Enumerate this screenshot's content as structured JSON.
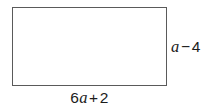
{
  "figure": {
    "type": "rectangle-diagram",
    "background_color": "#ffffff",
    "shape": {
      "name": "rectangle",
      "fill_color": "#ffffff",
      "stroke_color": "#5a5a5a",
      "stroke_width_px": 1.6,
      "x": 12,
      "y": 7,
      "width": 155,
      "height": 79
    },
    "labels": {
      "width": {
        "full_text": "6a + 2",
        "coefficient": "6",
        "variable": "a",
        "operator": "+",
        "constant": "2",
        "position": "bottom",
        "text_color": "#1c1c1c"
      },
      "height": {
        "full_text": "a − 4",
        "variable": "a",
        "operator": "−",
        "constant": "4",
        "position": "right",
        "text_color": "#1c1c1c"
      }
    }
  }
}
